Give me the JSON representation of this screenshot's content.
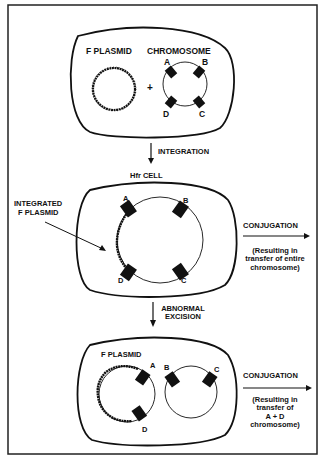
{
  "panel1": {
    "plasmid_label": "F PLASMID",
    "chromosome_label": "CHROMOSOME",
    "plus": "+",
    "markers": {
      "a": "A",
      "b": "B",
      "c": "C",
      "d": "D"
    }
  },
  "step1": {
    "arrow_label": "INTEGRATION",
    "result_label": "Hfr CELL"
  },
  "panel2": {
    "pointer_label_line1": "INTEGRATED",
    "pointer_label_line2": "F PLASMID",
    "markers": {
      "a": "A",
      "b": "B",
      "c": "C",
      "d": "D"
    },
    "conjugation_label": "CONJUGATION",
    "note_line1": "(Resulting in",
    "note_line2": "transfer of entire",
    "note_line3": "chromosome)"
  },
  "step2": {
    "arrow_label_line1": "ABNORMAL",
    "arrow_label_line2": "EXCISION"
  },
  "panel3": {
    "plasmid_label": "F PLASMID",
    "markers": {
      "a": "A",
      "b": "B",
      "c": "C",
      "d": "D"
    },
    "conjugation_label": "CONJUGATION",
    "note_line1": "(Resulting in",
    "note_line2": "transfer of",
    "note_line3": "A + D",
    "note_line4": "chromosome)"
  },
  "colors": {
    "ink": "#111111",
    "background": "#ffffff"
  }
}
